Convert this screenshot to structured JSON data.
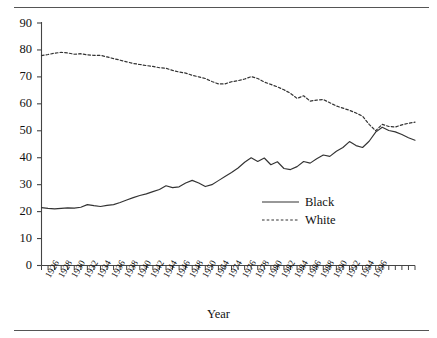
{
  "chart_data": {
    "type": "line",
    "title": "",
    "xlabel": "Year",
    "ylabel": "",
    "ylim": [
      0,
      90
    ],
    "ytick_step": 10,
    "yticks": [
      0,
      10,
      20,
      30,
      40,
      50,
      60,
      70,
      80,
      90
    ],
    "grid": false,
    "legend_position": "center-right",
    "x_tick_count": 57,
    "x_tick_labels": [
      "1926",
      "1928",
      "1930",
      "1932",
      "1934",
      "1936",
      "1938",
      "1940",
      "1942",
      "1944",
      "1946",
      "1948",
      "1950",
      "1964",
      "1974",
      "1976",
      "1978",
      "1980",
      "1982",
      "1984",
      "1986",
      "1988",
      "1990",
      "1992",
      "1994",
      "1996"
    ],
    "x_label_every_other_tick": true,
    "x": [
      1926,
      1927,
      1928,
      1929,
      1930,
      1931,
      1932,
      1933,
      1934,
      1935,
      1936,
      1937,
      1938,
      1939,
      1940,
      1941,
      1942,
      1943,
      1944,
      1945,
      1946,
      1947,
      1948,
      1949,
      1950,
      1964,
      1965,
      1966,
      1967,
      1968,
      1969,
      1970,
      1971,
      1972,
      1973,
      1974,
      1975,
      1976,
      1977,
      1978,
      1979,
      1980,
      1981,
      1982,
      1983,
      1984,
      1985,
      1986,
      1987,
      1988,
      1989,
      1990,
      1991,
      1992,
      1993,
      1994,
      1995,
      1996
    ],
    "series": [
      {
        "name": "Black",
        "style": "solid",
        "color": "#333333",
        "values": [
          21.5,
          21.2,
          21.0,
          21.2,
          21.4,
          21.3,
          21.6,
          22.6,
          22.2,
          21.9,
          22.3,
          22.6,
          23.4,
          24.3,
          25.2,
          26.0,
          26.6,
          27.4,
          28.2,
          29.6,
          28.9,
          29.2,
          30.6,
          31.6,
          30.6,
          29.3,
          30.0,
          31.5,
          33.0,
          34.5,
          36.2,
          38.3,
          40.0,
          38.6,
          39.9,
          37.4,
          38.5,
          36.0,
          35.6,
          36.7,
          38.6,
          38.0,
          39.6,
          41.0,
          40.5,
          42.4,
          43.8,
          46.0,
          44.5,
          43.8,
          46.1,
          49.5,
          51.3,
          50.1,
          49.6,
          48.6,
          47.4,
          46.5
        ]
      },
      {
        "name": "White",
        "style": "dotted",
        "color": "#333333",
        "values": [
          77.9,
          78.3,
          78.8,
          79.1,
          78.9,
          78.4,
          78.6,
          78.2,
          78.0,
          78.0,
          77.4,
          76.8,
          76.2,
          75.6,
          75.0,
          74.6,
          74.2,
          73.9,
          73.4,
          73.2,
          72.4,
          71.8,
          71.4,
          70.6,
          70.0,
          69.4,
          68.3,
          67.4,
          67.4,
          68.2,
          68.6,
          69.2,
          70.1,
          69.4,
          68.1,
          67.2,
          66.3,
          65.2,
          63.9,
          62.0,
          63.0,
          61.0,
          61.4,
          61.6,
          60.4,
          59.2,
          58.4,
          57.6,
          56.6,
          55.4,
          52.4,
          50.0,
          52.4,
          51.6,
          51.4,
          52.2,
          52.8,
          53.2
        ]
      }
    ]
  },
  "legend": {
    "items": [
      {
        "label": "Black",
        "style": "solid"
      },
      {
        "label": "White",
        "style": "dotted"
      }
    ]
  },
  "axis": {
    "x_title": "Year"
  }
}
